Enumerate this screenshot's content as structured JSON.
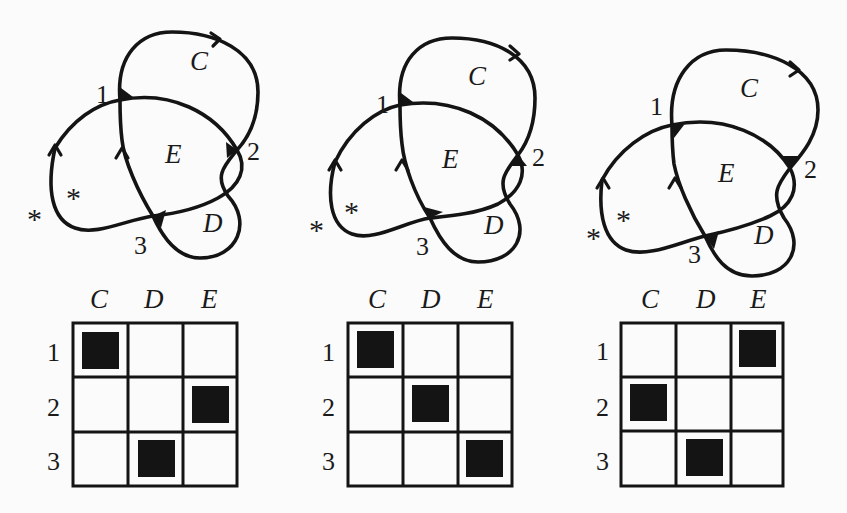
{
  "figure": {
    "background": "#fbfbfb",
    "ink": "#141414",
    "panels": [
      {
        "id": "panel-1",
        "knot": {
          "regions": {
            "C": "C",
            "D": "D",
            "E": "E"
          },
          "crossings": [
            "1",
            "2",
            "3"
          ],
          "stars": [
            "*",
            "*"
          ],
          "marked_regions": {
            "1": "C",
            "2": "E",
            "3": "D"
          }
        },
        "grid": {
          "columns": [
            "C",
            "D",
            "E"
          ],
          "rows": [
            "1",
            "2",
            "3"
          ],
          "filled": [
            [
              1,
              0,
              0
            ],
            [
              0,
              0,
              1
            ],
            [
              0,
              1,
              0
            ]
          ]
        }
      },
      {
        "id": "panel-2",
        "knot": {
          "regions": {
            "C": "C",
            "D": "D",
            "E": "E"
          },
          "crossings": [
            "1",
            "2",
            "3"
          ],
          "stars": [
            "*",
            "*"
          ],
          "marked_regions": {
            "1": "C",
            "2": "D",
            "3": "E"
          }
        },
        "grid": {
          "columns": [
            "C",
            "D",
            "E"
          ],
          "rows": [
            "1",
            "2",
            "3"
          ],
          "filled": [
            [
              1,
              0,
              0
            ],
            [
              0,
              1,
              0
            ],
            [
              0,
              0,
              1
            ]
          ]
        }
      },
      {
        "id": "panel-3",
        "knot": {
          "regions": {
            "C": "C",
            "D": "D",
            "E": "E"
          },
          "crossings": [
            "1",
            "2",
            "3"
          ],
          "stars": [
            "*",
            "*"
          ],
          "marked_regions": {
            "1": "E",
            "2": "C",
            "3": "D"
          }
        },
        "grid": {
          "columns": [
            "C",
            "D",
            "E"
          ],
          "rows": [
            "1",
            "2",
            "3"
          ],
          "filled": [
            [
              0,
              0,
              1
            ],
            [
              1,
              0,
              0
            ],
            [
              0,
              1,
              0
            ]
          ]
        }
      }
    ]
  }
}
